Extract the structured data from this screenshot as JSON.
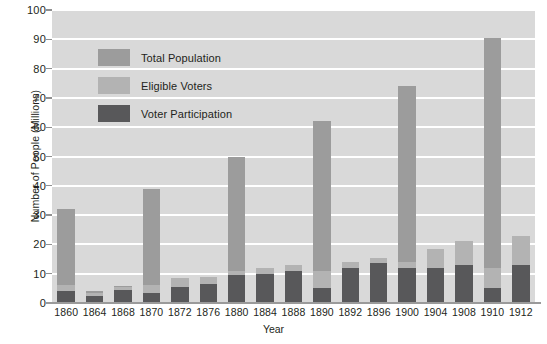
{
  "chart_data": {
    "type": "bar",
    "title": "",
    "xlabel": "Year",
    "ylabel": "Number of People (Millions)",
    "ylim": [
      0,
      100
    ],
    "ytick_step": 10,
    "yticks": [
      0,
      10,
      20,
      30,
      40,
      50,
      60,
      70,
      80,
      90,
      100
    ],
    "grid": "horizontal-white-lines",
    "legend_position": "inside-upper-left",
    "stacked": true,
    "categories": [
      "1860",
      "1864",
      "1868",
      "1870",
      "1872",
      "1876",
      "1880",
      "1884",
      "1888",
      "1890",
      "1892",
      "1896",
      "1900",
      "1904",
      "1908",
      "1910",
      "1912"
    ],
    "series": [
      {
        "name": "Total Population",
        "color": "#9c9c9c",
        "values": [
          32.0,
          4.0,
          5.7,
          39.0,
          8.5,
          9.0,
          50.0,
          12.0,
          13.0,
          62.0,
          14.0,
          15.5,
          74.0,
          18.5,
          21.0,
          90.5,
          23.0
        ]
      },
      {
        "name": "Eligible Voters",
        "color": "#b3b3b3",
        "values": [
          6.0,
          3.3,
          5.3,
          6.2,
          8.5,
          9.0,
          11.0,
          12.0,
          13.0,
          11.0,
          14.0,
          15.5,
          14.0,
          18.5,
          21.0,
          12.0,
          23.0
        ]
      },
      {
        "name": "Voter Participation",
        "color": "#58585a",
        "values": [
          4.0,
          2.5,
          4.3,
          3.3,
          5.5,
          6.5,
          9.5,
          10.0,
          11.0,
          5.0,
          12.0,
          13.5,
          12.0,
          12.0,
          13.0,
          5.0,
          13.0
        ]
      }
    ]
  },
  "legend": {
    "items": [
      {
        "label": "Total Population",
        "color": "#9c9c9c"
      },
      {
        "label": "Eligible Voters",
        "color": "#b3b3b3"
      },
      {
        "label": "Voter Participation",
        "color": "#58585a"
      }
    ]
  },
  "colors": {
    "plot_background": "#d9d9d9",
    "gridline": "#ffffff",
    "axis": "#9a9a9a",
    "text": "#231f20"
  }
}
